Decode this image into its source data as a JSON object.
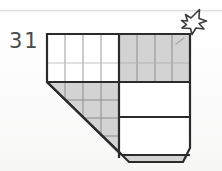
{
  "page": {
    "background_color": "#fdfdfd",
    "paper_edge_color": "#d9d9d7"
  },
  "annotation": {
    "number_label": "31",
    "label_color": "#4a4a4a",
    "pencil_mark": "diagonal-tick",
    "pencil_mark_cell": "top-right-gray-cell"
  },
  "cursor": {
    "icon": "arrow-cursor-up-left",
    "fill": "#ffffff",
    "stroke": "#3c3c3c"
  },
  "shape": {
    "name": "pentagon-with-chamfered-corners",
    "outline_color": "#2b2b2b",
    "fill_white": "#ffffff",
    "fill_gray": "#d3d3d3",
    "grid_line_color": "#9a9a9a",
    "outline_width": 2.2
  },
  "regions": [
    {
      "id": "top-left-white-band",
      "fill": "white",
      "columns": 4,
      "rows": 2,
      "x": 47,
      "y": 34,
      "width": 72,
      "height": 48
    },
    {
      "id": "top-right-gray-band",
      "fill": "gray",
      "columns": 4,
      "rows": 2,
      "x": 119,
      "y": 34,
      "width": 71,
      "height": 48
    },
    {
      "id": "lower-left-gray-triangle",
      "fill": "gray",
      "columns": 4,
      "rows": 4,
      "x": 47,
      "y": 82,
      "width": 72,
      "height": 73,
      "note": "clipped by diagonal edge"
    },
    {
      "id": "middle-right-white-box",
      "fill": "white",
      "columns": 1,
      "rows": 1,
      "x": 119,
      "y": 83,
      "width": 71,
      "height": 34
    },
    {
      "id": "lower-right-white-box",
      "fill": "white",
      "columns": 1,
      "rows": 1,
      "x": 119,
      "y": 117,
      "width": 71,
      "height": 38
    },
    {
      "id": "bottom-gray-strip",
      "fill": "gray",
      "x": 119,
      "y": 155,
      "width": 71,
      "height": 11,
      "note": "chamfered both ends"
    }
  ],
  "geometry": {
    "outline_points": "47,34 190,34 190,148 182,162 129,162 122,155 47,82",
    "diagonal_edge": "47,82 to 122,155",
    "grid_step_x": 18,
    "grid_step_y": 18
  }
}
